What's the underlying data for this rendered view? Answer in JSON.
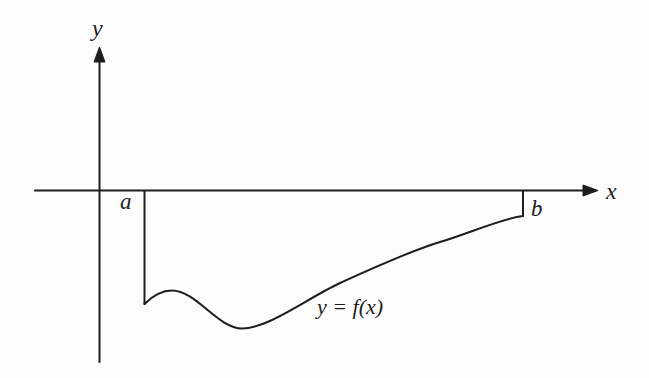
{
  "figure": {
    "background_color": "#fdfdfd",
    "ink_color": "#1d1d1d",
    "labels": {
      "y_axis": "y",
      "x_axis": "x",
      "lower_bound": "a",
      "upper_bound": "b",
      "curve": "y = f(x)"
    },
    "geometry": {
      "x_axis_path": "M 35 190.5 L 586 190.5",
      "x_arrow_points": "598,190.5 583,185 583,196",
      "y_axis_path": "M 99.5 362 L 99.5 60",
      "y_arrow_points": "99.5,47 94,62 105,62",
      "a_line_path": "M 144.5 191 L 144.5 304",
      "b_line_path": "M 523 191 L 523 216",
      "curve_path": "M 144.5 304 C 152 296.5 161 290.5 172 290.5 C 196 290.5 218 328.5 242 328.5 C 268 328.5 306 299 340 283 C 373 268 410 251 440 242 C 470 233 503 218 523 216"
    }
  }
}
